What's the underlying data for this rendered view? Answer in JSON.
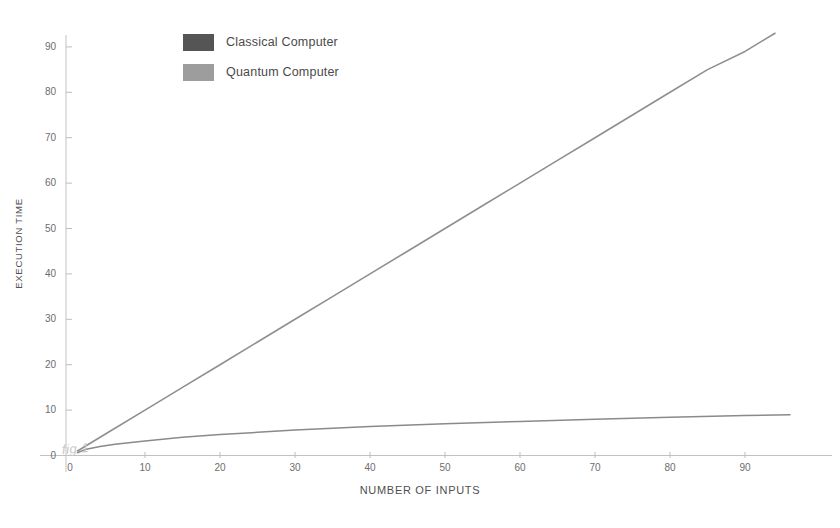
{
  "chart_data": {
    "type": "line",
    "title": "",
    "xlabel": "NUMBER OF INPUTS",
    "ylabel": "EXECUTION TIME",
    "xlim": [
      0,
      97
    ],
    "ylim": [
      0,
      95
    ],
    "xticks": [
      0,
      10,
      20,
      30,
      40,
      50,
      60,
      70,
      80,
      90
    ],
    "yticks": [
      0,
      10,
      20,
      30,
      40,
      50,
      60,
      70,
      80,
      90
    ],
    "grid": false,
    "legend_position": "top-left",
    "annotation": "fig 1",
    "series": [
      {
        "name": "Classical Computer",
        "color": "#555555",
        "line_color": "#8f8f8f",
        "shape": "linear",
        "x": [
          1,
          5,
          10,
          15,
          20,
          25,
          30,
          35,
          40,
          45,
          50,
          55,
          60,
          65,
          70,
          75,
          80,
          85,
          90,
          94
        ],
        "values": [
          1,
          5,
          10,
          15,
          20,
          25,
          30,
          35,
          40,
          45,
          50,
          55,
          60,
          65,
          70,
          75,
          80,
          85,
          89,
          93
        ]
      },
      {
        "name": "Quantum Computer",
        "color": "#9d9d9d",
        "line_color": "#8a8a8a",
        "shape": "logarithmic",
        "x": [
          1,
          2,
          4,
          6,
          10,
          15,
          20,
          25,
          30,
          35,
          40,
          50,
          60,
          70,
          80,
          90,
          96
        ],
        "values": [
          0.6,
          1.3,
          2.0,
          2.5,
          3.2,
          4.0,
          4.6,
          5.1,
          5.6,
          6.0,
          6.4,
          7.0,
          7.5,
          8.0,
          8.4,
          8.8,
          9.0
        ]
      }
    ]
  },
  "legend": {
    "items": [
      {
        "label": "Classical Computer",
        "swatch": "#555555"
      },
      {
        "label": "Quantum Computer",
        "swatch": "#9d9d9d"
      }
    ]
  },
  "axes": {
    "x_title": "NUMBER OF INPUTS",
    "y_title": "EXECUTION TIME",
    "x_tick_labels": [
      "0",
      "10",
      "20",
      "30",
      "40",
      "50",
      "60",
      "70",
      "80",
      "90"
    ],
    "y_tick_labels": [
      "0",
      "10",
      "20",
      "30",
      "40",
      "50",
      "60",
      "70",
      "80",
      "90"
    ]
  },
  "annotation": {
    "figure_label": "fig 1"
  }
}
